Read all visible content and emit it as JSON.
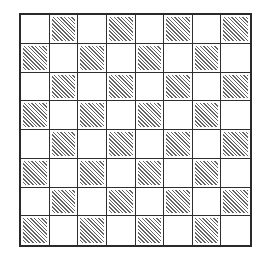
{
  "diagram": {
    "type": "checkerboard",
    "rows": 8,
    "columns": 8,
    "top_left_cell": "white",
    "shaded_cell_style": "diagonal-hatching",
    "hatch_direction": "top-left-to-bottom-right",
    "line_color": "#2a2a2a",
    "hatch_color": "#4a4a4a",
    "background_color": "#ffffff",
    "cells": [
      [
        "white",
        "hatched",
        "white",
        "hatched",
        "white",
        "hatched",
        "white",
        "hatched"
      ],
      [
        "hatched",
        "white",
        "hatched",
        "white",
        "hatched",
        "white",
        "hatched",
        "white"
      ],
      [
        "white",
        "hatched",
        "white",
        "hatched",
        "white",
        "hatched",
        "white",
        "hatched"
      ],
      [
        "hatched",
        "white",
        "hatched",
        "white",
        "hatched",
        "white",
        "hatched",
        "white"
      ],
      [
        "white",
        "hatched",
        "white",
        "hatched",
        "white",
        "hatched",
        "white",
        "hatched"
      ],
      [
        "hatched",
        "white",
        "hatched",
        "white",
        "hatched",
        "white",
        "hatched",
        "white"
      ],
      [
        "white",
        "hatched",
        "white",
        "hatched",
        "white",
        "hatched",
        "white",
        "hatched"
      ],
      [
        "hatched",
        "white",
        "hatched",
        "white",
        "hatched",
        "white",
        "hatched",
        "white"
      ]
    ]
  }
}
